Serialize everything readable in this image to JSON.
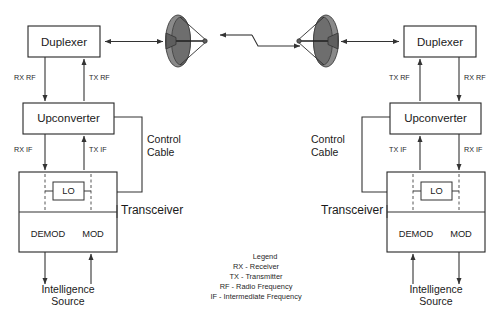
{
  "diagram": {
    "background_color": "#ffffff",
    "line_color": "#333333",
    "dish_color": "#8a8a8a"
  },
  "left_station": {
    "duplexer_label": "Duplexer",
    "upconverter_label": "Upconverter",
    "lo_label": "LO",
    "demod_label": "DEMOD",
    "mod_label": "MOD",
    "transceiver_label": "Transceiver",
    "control_cable_line1": "Control",
    "control_cable_line2": "Cable",
    "intelligence_line1": "Intelligence",
    "intelligence_line2": "Source",
    "rx_rf_label": "RX RF",
    "tx_rf_label": "TX RF",
    "rx_if_label": "RX IF",
    "tx_if_label": "TX IF"
  },
  "right_station": {
    "duplexer_label": "Duplexer",
    "upconverter_label": "Upconverter",
    "lo_label": "LO",
    "demod_label": "DEMOD",
    "mod_label": "MOD",
    "transceiver_label": "Transceiver",
    "control_cable_line1": "Control",
    "control_cable_line2": "Cable",
    "intelligence_line1": "Intelligence",
    "intelligence_line2": "Source",
    "rx_rf_label": "RX RF",
    "tx_rf_label": "TX RF",
    "rx_if_label": "RX IF",
    "tx_if_label": "TX IF"
  },
  "legend": {
    "title": "Legend",
    "items": [
      "RX - Receiver",
      "TX - Transmitter",
      "RF - Radio Frequency",
      "IF - Intermediate Frequency"
    ]
  }
}
